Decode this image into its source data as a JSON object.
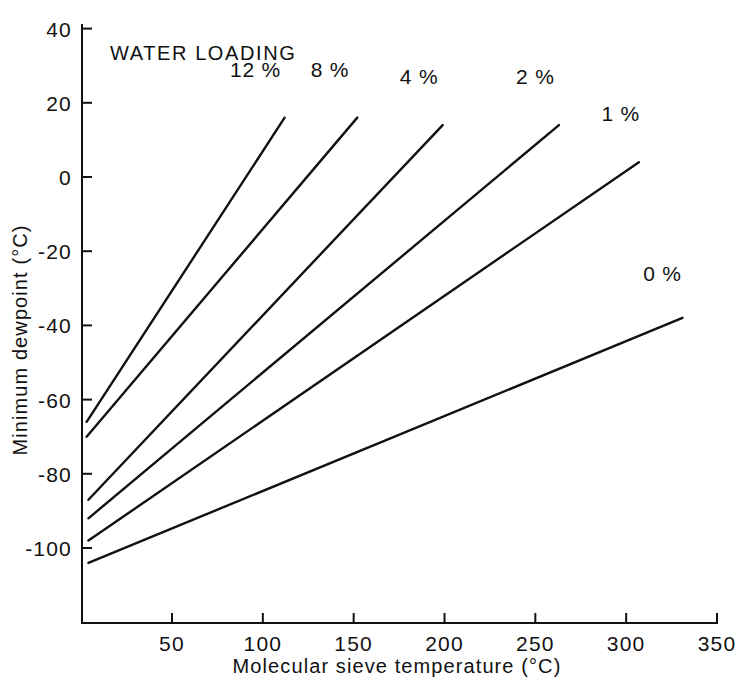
{
  "chart_data": {
    "type": "line",
    "title": "",
    "annotation": "WATER LOADING",
    "xlabel": "Molecular sieve temperature (°C)",
    "ylabel": "Minimum dewpoint (°C)",
    "xlim": [
      0,
      350
    ],
    "ylim": [
      -110,
      40
    ],
    "xticks": [
      50,
      100,
      150,
      200,
      250,
      300,
      350
    ],
    "xtick_labels": [
      "50",
      "100",
      "150",
      "200",
      "250",
      "300",
      "350"
    ],
    "yticks": [
      40,
      20,
      0,
      -20,
      -40,
      -60,
      -80,
      -100
    ],
    "ytick_labels": [
      "40",
      "20",
      "0",
      "-20",
      "-40",
      "-60",
      "-80",
      "-100"
    ],
    "grid": false,
    "legend_position": "inline-end-labels",
    "series": [
      {
        "name": "12 %",
        "label": "12 %",
        "x": [
          3,
          112
        ],
        "y": [
          -66,
          16
        ],
        "label_x": 96,
        "label_y": 27
      },
      {
        "name": "8 %",
        "label": "8 %",
        "x": [
          3,
          152
        ],
        "y": [
          -70,
          16
        ],
        "label_x": 137,
        "label_y": 27
      },
      {
        "name": "4 %",
        "label": "4 %",
        "x": [
          4,
          199
        ],
        "y": [
          -87,
          14
        ],
        "label_x": 186,
        "label_y": 25
      },
      {
        "name": "2 %",
        "label": "2 %",
        "x": [
          4,
          263
        ],
        "y": [
          -92,
          14
        ],
        "label_x": 250,
        "label_y": 25
      },
      {
        "name": "1 %",
        "label": "1 %",
        "x": [
          4,
          307
        ],
        "y": [
          -98,
          4
        ],
        "label_x": 297,
        "label_y": 15
      },
      {
        "name": "0 %",
        "label": "0 %",
        "x": [
          4,
          331
        ],
        "y": [
          -104,
          -38
        ],
        "label_x": 320,
        "label_y": -28
      }
    ]
  }
}
